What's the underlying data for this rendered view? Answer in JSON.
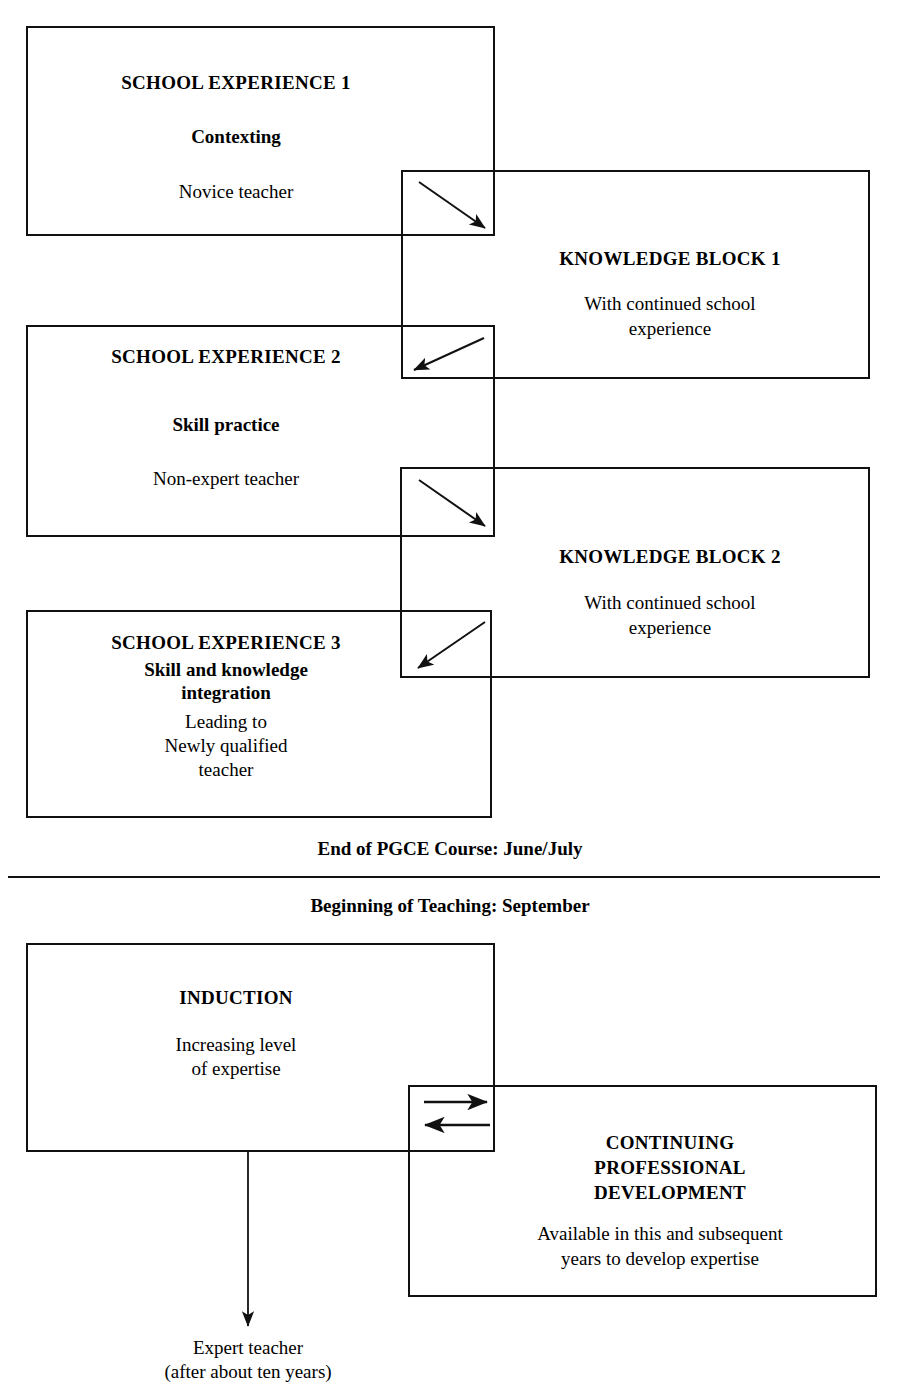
{
  "diagram": {
    "stages": [
      {
        "id": "school-experience-1",
        "title": "SCHOOL EXPERIENCE 1",
        "subtitle": "Contexting",
        "detail": "Novice teacher"
      },
      {
        "id": "knowledge-block-1",
        "title": "KNOWLEDGE BLOCK 1",
        "detail_line_1": "With continued school",
        "detail_line_2": "experience"
      },
      {
        "id": "school-experience-2",
        "title": "SCHOOL EXPERIENCE 2",
        "subtitle": "Skill practice",
        "detail": "Non-expert teacher"
      },
      {
        "id": "knowledge-block-2",
        "title": "KNOWLEDGE BLOCK 2",
        "detail_line_1": "With continued school",
        "detail_line_2": "experience"
      },
      {
        "id": "school-experience-3",
        "title": "SCHOOL EXPERIENCE 3",
        "subtitle_line_1": "Skill and knowledge",
        "subtitle_line_2": "integration",
        "detail_line_1": "Leading to",
        "detail_line_2": "Newly qualified",
        "detail_line_3": "teacher"
      },
      {
        "id": "induction",
        "title": "INDUCTION",
        "detail_line_1": "Increasing level",
        "detail_line_2": "of expertise"
      },
      {
        "id": "continuing-professional-development",
        "title_line_1": "CONTINUING",
        "title_line_2": "PROFESSIONAL",
        "title_line_3": "DEVELOPMENT",
        "detail_line_1": "Available in this and subsequent",
        "detail_line_2": "years to develop expertise"
      }
    ],
    "milestones": {
      "end_of_course": "End of PGCE Course: June/July",
      "beginning_of_teaching": "Beginning of Teaching: September"
    },
    "outcome": {
      "line_1": "Expert teacher",
      "line_2": "(after about ten years)"
    },
    "colors": {
      "stroke": "#111111",
      "background": "#ffffff",
      "text": "#000000"
    }
  }
}
